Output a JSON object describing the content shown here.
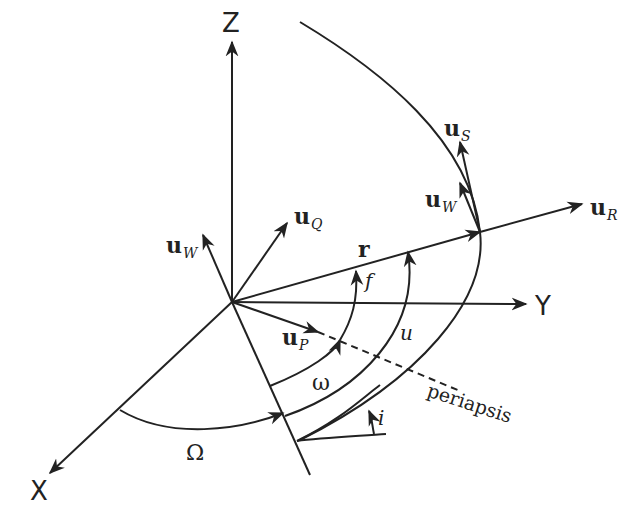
{
  "diagram": {
    "axes": {
      "x_label": "X",
      "y_label": "Y",
      "z_label": "Z"
    },
    "vectors": {
      "u_W_origin": {
        "base": "u",
        "sub": "W"
      },
      "u_Q": {
        "base": "u",
        "sub": "Q"
      },
      "u_P": {
        "base": "u",
        "sub": "P"
      },
      "r": {
        "base": "r"
      },
      "u_R": {
        "base": "u",
        "sub": "R"
      },
      "u_S": {
        "base": "u",
        "sub": "S"
      },
      "u_W_orbit": {
        "base": "u",
        "sub": "W"
      }
    },
    "angles": {
      "Omega": "Ω",
      "omega": "ω",
      "f": "f",
      "u": "u",
      "i": "i"
    },
    "annotations": {
      "periapsis": "periapsis"
    },
    "colors": {
      "ink": "#222222",
      "background": "#ffffff"
    }
  }
}
